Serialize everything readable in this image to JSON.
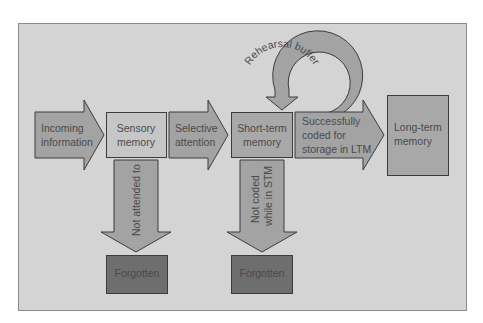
{
  "colors": {
    "background": "#ffffff",
    "panel": "#d4d4d4",
    "panel_border": "#8a8a8a",
    "arrow_fill": "#a3a3a3",
    "box_light": "#c6c6c6",
    "box_mid": "#a8a8a8",
    "box_dark": "#6e6e6e",
    "stroke": "#3c3c3c",
    "text": "#4a4a4a"
  },
  "diagram": {
    "nodes": {
      "incoming": {
        "line1": "Incoming",
        "line2": "information"
      },
      "sensory": {
        "line1": "Sensory",
        "line2": "memory"
      },
      "selective": {
        "line1": "Selective",
        "line2": "attention"
      },
      "stm": {
        "line1": "Short-term",
        "line2": "memory"
      },
      "coded": {
        "line1": "Successfully",
        "line2": "coded for",
        "line3": "storage in LTM"
      },
      "ltm": {
        "line1": "Long-term",
        "line2": "memory"
      },
      "forgotten1": {
        "label": "Forgotten"
      },
      "forgotten2": {
        "label": "Forgotten"
      }
    },
    "edges": {
      "not_attended": {
        "label": "Not attended to"
      },
      "not_coded": {
        "line1": "Not coded",
        "line2": "while in STM"
      },
      "rehearsal": {
        "label": "Rehearsal buffer"
      }
    }
  }
}
